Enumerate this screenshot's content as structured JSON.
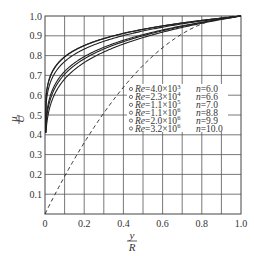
{
  "chart_data": {
    "type": "line",
    "title": "",
    "xlabel": "y/R",
    "ylabel": "u/U",
    "xlabel_num": "y",
    "xlabel_den": "R",
    "ylabel_num": "u",
    "ylabel_den": "U",
    "xlim": [
      0,
      1.0
    ],
    "ylim": [
      0,
      1.0
    ],
    "grid": true,
    "x_ticks": [
      "0",
      "0.2",
      "0.4",
      "0.6",
      "0.8",
      "1.0"
    ],
    "y_ticks": [
      "0.1",
      "0.2",
      "0.3",
      "0.4",
      "0.5",
      "0.6",
      "0.7",
      "0.8",
      "0.9",
      "1.0"
    ],
    "legend_position": "center-right",
    "series": [
      {
        "name": "Re=4.0×10³ n=6.0",
        "re": "4.0×10",
        "re_exp": "3",
        "n": "n=6.0",
        "exponent_n": 6.0,
        "x": [
          0.005,
          0.01,
          0.05,
          0.1,
          0.2,
          0.3,
          0.4,
          0.5,
          0.6,
          0.7,
          0.8,
          0.9,
          1.0
        ],
        "values": [
          0.41,
          0.46,
          0.61,
          0.68,
          0.76,
          0.82,
          0.86,
          0.89,
          0.92,
          0.94,
          0.96,
          0.98,
          1.0
        ]
      },
      {
        "name": "Re=2.3×10⁴ n=6.6",
        "re": "2.3×10",
        "re_exp": "4",
        "n": "n=6.6",
        "exponent_n": 6.6,
        "x": [
          0.005,
          0.01,
          0.05,
          0.1,
          0.2,
          0.3,
          0.4,
          0.5,
          0.6,
          0.7,
          0.8,
          0.9,
          1.0
        ],
        "values": [
          0.45,
          0.5,
          0.64,
          0.71,
          0.78,
          0.83,
          0.87,
          0.9,
          0.93,
          0.95,
          0.97,
          0.98,
          1.0
        ]
      },
      {
        "name": "Re=1.1×10⁵ n=7.0",
        "re": "1.1×10",
        "re_exp": "5",
        "n": "n=7.0",
        "exponent_n": 7.0,
        "x": [
          0.005,
          0.01,
          0.05,
          0.1,
          0.2,
          0.3,
          0.4,
          0.5,
          0.6,
          0.7,
          0.8,
          0.9,
          1.0
        ],
        "values": [
          0.47,
          0.52,
          0.65,
          0.72,
          0.79,
          0.84,
          0.88,
          0.91,
          0.93,
          0.95,
          0.97,
          0.98,
          1.0
        ]
      },
      {
        "name": "Re=1.1×10⁶ n=8.8",
        "re": "1.1×10",
        "re_exp": "6",
        "n": "n=8.8",
        "exponent_n": 8.8,
        "x": [
          0.005,
          0.01,
          0.05,
          0.1,
          0.2,
          0.3,
          0.4,
          0.5,
          0.6,
          0.7,
          0.8,
          0.9,
          1.0
        ],
        "values": [
          0.55,
          0.59,
          0.71,
          0.77,
          0.83,
          0.87,
          0.9,
          0.92,
          0.94,
          0.96,
          0.97,
          0.99,
          1.0
        ]
      },
      {
        "name": "Re=2.0×10⁶ n=9.9",
        "re": "2.0×10",
        "re_exp": "6",
        "n": "n=9.9",
        "exponent_n": 9.9,
        "x": [
          0.005,
          0.01,
          0.05,
          0.1,
          0.2,
          0.3,
          0.4,
          0.5,
          0.6,
          0.7,
          0.8,
          0.9,
          1.0
        ],
        "values": [
          0.59,
          0.63,
          0.74,
          0.79,
          0.85,
          0.89,
          0.91,
          0.93,
          0.95,
          0.96,
          0.98,
          0.99,
          1.0
        ]
      },
      {
        "name": "Re=3.2×10⁶ n=10.0",
        "re": "3.2×10",
        "re_exp": "6",
        "n": "n=10.0",
        "exponent_n": 10.0,
        "x": [
          0.005,
          0.01,
          0.05,
          0.1,
          0.2,
          0.3,
          0.4,
          0.5,
          0.6,
          0.7,
          0.8,
          0.9,
          1.0
        ],
        "values": [
          0.59,
          0.63,
          0.74,
          0.79,
          0.85,
          0.89,
          0.91,
          0.93,
          0.95,
          0.96,
          0.98,
          0.99,
          1.0
        ]
      },
      {
        "name": "laminar (dashed)",
        "style": "dashed",
        "x": [
          0,
          0.1,
          0.2,
          0.3,
          0.4,
          0.5,
          0.6,
          0.7,
          0.8,
          0.9,
          1.0
        ],
        "values": [
          0,
          0.19,
          0.36,
          0.51,
          0.64,
          0.75,
          0.84,
          0.91,
          0.96,
          0.99,
          1.0
        ]
      }
    ]
  }
}
